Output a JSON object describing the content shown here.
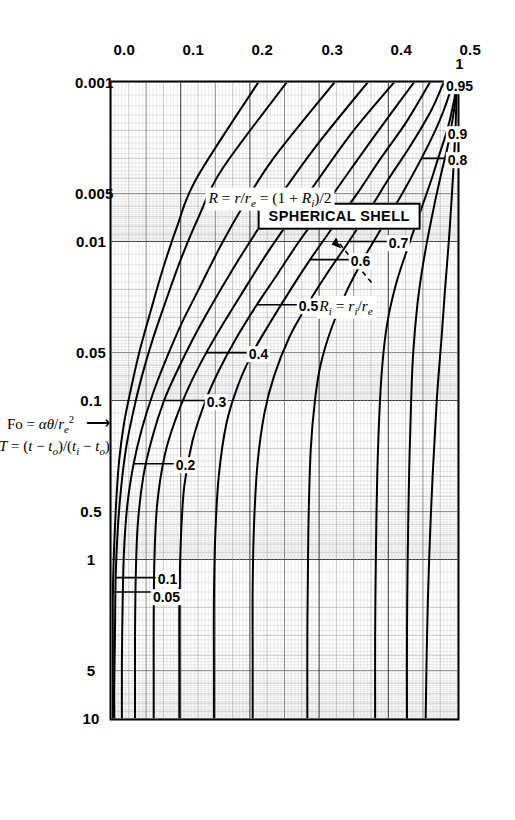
{
  "figure": {
    "title_box": "SPHERICAL SHELL",
    "definition": "R = r/re = (1 + Ri)/2",
    "annotation": "Ri = ri/re",
    "orientation": "rotated-90-clockwise"
  },
  "axes": {
    "x": {
      "label": "Fo = αθ/re²",
      "label_arrow": "⟶",
      "scale": "log",
      "range": [
        0.001,
        10
      ],
      "ticks": [
        "0.001",
        "0.005",
        "0.01",
        "0.05",
        "0.1",
        "0.5",
        "1",
        "5",
        "10"
      ],
      "tick_values": [
        0.001,
        0.005,
        0.01,
        0.05,
        0.1,
        0.5,
        1,
        5,
        10
      ]
    },
    "y": {
      "label": "T = (t − to)/(ti − to)",
      "label_arrow": "⟵",
      "scale": "linear",
      "range": [
        0.0,
        0.5
      ],
      "ticks": [
        "0.0",
        "0.1",
        "0.2",
        "0.3",
        "0.4",
        "0.5"
      ],
      "tick_values": [
        0.0,
        0.1,
        0.2,
        0.3,
        0.4,
        0.5
      ]
    }
  },
  "chart_data": {
    "type": "line",
    "title": "SPHERICAL SHELL",
    "xlabel": "Fo = αθ/re²",
    "ylabel": "T = (t − to)/(ti − to)",
    "xscale": "log",
    "yscale": "linear",
    "xlim": [
      0.001,
      10
    ],
    "ylim": [
      0.0,
      0.5
    ],
    "grid": "log-linear fine graph paper grid",
    "legend": "curve end labels (Ri values)",
    "series": [
      {
        "name": "1",
        "label": "1",
        "x": [
          0.001,
          0.0012,
          0.0015,
          0.002,
          0.003,
          0.005,
          0.008,
          0.012,
          0.02,
          0.04,
          0.1,
          0.3,
          1,
          3,
          10
        ],
        "y": [
          0.5,
          0.499,
          0.498,
          0.497,
          0.495,
          0.492,
          0.489,
          0.486,
          0.482,
          0.477,
          0.47,
          0.464,
          0.459,
          0.456,
          0.454
        ]
      },
      {
        "name": "0.95",
        "label": "0.95",
        "x": [
          0.001,
          0.0013,
          0.0018,
          0.0025,
          0.0035,
          0.005,
          0.007,
          0.01,
          0.015,
          0.025,
          0.05,
          0.1,
          0.3,
          1,
          3,
          10
        ],
        "y": [
          0.5,
          0.497,
          0.492,
          0.486,
          0.478,
          0.47,
          0.463,
          0.456,
          0.449,
          0.442,
          0.436,
          0.433,
          0.43,
          0.428,
          0.427,
          0.427
        ]
      },
      {
        "name": "0.9",
        "label": "0.9",
        "x": [
          0.001,
          0.0015,
          0.002,
          0.003,
          0.004,
          0.006,
          0.008,
          0.012,
          0.018,
          0.03,
          0.05,
          0.1,
          0.3,
          1,
          3,
          10
        ],
        "y": [
          0.5,
          0.492,
          0.485,
          0.472,
          0.463,
          0.449,
          0.439,
          0.425,
          0.412,
          0.4,
          0.393,
          0.388,
          0.384,
          0.382,
          0.381,
          0.381
        ]
      },
      {
        "name": "0.8",
        "label": "0.8",
        "x": [
          0.001,
          0.0015,
          0.002,
          0.003,
          0.005,
          0.008,
          0.012,
          0.02,
          0.035,
          0.06,
          0.1,
          0.2,
          0.5,
          1,
          3,
          10
        ],
        "y": [
          0.494,
          0.48,
          0.468,
          0.448,
          0.42,
          0.392,
          0.368,
          0.341,
          0.318,
          0.302,
          0.294,
          0.288,
          0.285,
          0.284,
          0.283,
          0.283
        ]
      },
      {
        "name": "0.7",
        "label": "0.7",
        "x": [
          0.001,
          0.0015,
          0.0025,
          0.004,
          0.006,
          0.01,
          0.016,
          0.025,
          0.04,
          0.07,
          0.12,
          0.25,
          0.6,
          1.5,
          4,
          10
        ],
        "y": [
          0.48,
          0.462,
          0.432,
          0.401,
          0.376,
          0.343,
          0.311,
          0.283,
          0.257,
          0.235,
          0.221,
          0.211,
          0.206,
          0.204,
          0.204,
          0.204
        ]
      },
      {
        "name": "0.6",
        "label": "0.6",
        "x": [
          0.001,
          0.0018,
          0.003,
          0.005,
          0.008,
          0.013,
          0.02,
          0.032,
          0.05,
          0.08,
          0.14,
          0.3,
          0.7,
          1.8,
          5,
          10
        ],
        "y": [
          0.46,
          0.425,
          0.389,
          0.355,
          0.321,
          0.287,
          0.259,
          0.23,
          0.204,
          0.183,
          0.166,
          0.155,
          0.15,
          0.148,
          0.148,
          0.148
        ]
      },
      {
        "name": "0.5",
        "label": "0.5",
        "x": [
          0.001,
          0.002,
          0.0035,
          0.006,
          0.01,
          0.016,
          0.025,
          0.04,
          0.065,
          0.1,
          0.18,
          0.35,
          0.8,
          2,
          5,
          10
        ],
        "y": [
          0.437,
          0.386,
          0.346,
          0.308,
          0.271,
          0.24,
          0.21,
          0.181,
          0.155,
          0.136,
          0.117,
          0.105,
          0.1,
          0.098,
          0.098,
          0.098
        ]
      },
      {
        "name": "0.4",
        "label": "0.4",
        "x": [
          0.001,
          0.002,
          0.004,
          0.007,
          0.012,
          0.02,
          0.032,
          0.05,
          0.08,
          0.13,
          0.22,
          0.45,
          1,
          2.5,
          6,
          10
        ],
        "y": [
          0.408,
          0.35,
          0.3,
          0.261,
          0.224,
          0.192,
          0.163,
          0.137,
          0.113,
          0.093,
          0.077,
          0.066,
          0.062,
          0.061,
          0.061,
          0.061
        ]
      },
      {
        "name": "0.3",
        "label": "0.3",
        "x": [
          0.001,
          0.0025,
          0.005,
          0.009,
          0.015,
          0.025,
          0.04,
          0.065,
          0.1,
          0.17,
          0.3,
          0.6,
          1.3,
          3,
          7,
          10
        ],
        "y": [
          0.37,
          0.296,
          0.246,
          0.207,
          0.175,
          0.145,
          0.119,
          0.095,
          0.076,
          0.059,
          0.046,
          0.038,
          0.035,
          0.034,
          0.034,
          0.034
        ]
      },
      {
        "name": "0.2",
        "label": "0.2",
        "x": [
          0.001,
          0.003,
          0.006,
          0.011,
          0.02,
          0.033,
          0.055,
          0.09,
          0.15,
          0.25,
          0.45,
          0.9,
          2,
          4.5,
          8,
          10
        ],
        "y": [
          0.322,
          0.234,
          0.19,
          0.156,
          0.126,
          0.101,
          0.079,
          0.06,
          0.044,
          0.032,
          0.023,
          0.018,
          0.016,
          0.015,
          0.015,
          0.015
        ]
      },
      {
        "name": "0.1",
        "label": "0.1",
        "x": [
          0.001,
          0.0035,
          0.007,
          0.013,
          0.024,
          0.042,
          0.07,
          0.12,
          0.2,
          0.35,
          0.65,
          1.3,
          3,
          6,
          9,
          10
        ],
        "y": [
          0.253,
          0.16,
          0.126,
          0.1,
          0.078,
          0.059,
          0.044,
          0.031,
          0.021,
          0.014,
          0.009,
          0.006,
          0.005,
          0.004,
          0.004,
          0.004
        ]
      },
      {
        "name": "0.05",
        "label": "0.05",
        "x": [
          0.001,
          0.004,
          0.008,
          0.015,
          0.028,
          0.05,
          0.085,
          0.14,
          0.24,
          0.42,
          0.8,
          1.6,
          3.5,
          7,
          10
        ],
        "y": [
          0.212,
          0.123,
          0.095,
          0.074,
          0.056,
          0.04,
          0.028,
          0.018,
          0.011,
          0.007,
          0.004,
          0.002,
          0.002,
          0.002,
          0.002
        ]
      }
    ]
  },
  "curve_labels": [
    {
      "text": "1",
      "pos": "left-edge"
    },
    {
      "text": "0.95",
      "pos": "left-edge"
    },
    {
      "text": "0.9",
      "pos": "left-edge"
    },
    {
      "text": "0.8",
      "pos": "upper-left"
    },
    {
      "text": "0.7",
      "pos": "upper-left"
    },
    {
      "text": "0.6",
      "pos": "upper-left"
    },
    {
      "text": "0.5",
      "pos": "upper-left"
    },
    {
      "text": "0.4",
      "pos": "upper-middle"
    },
    {
      "text": "0.3",
      "pos": "upper-middle"
    },
    {
      "text": "0.2",
      "pos": "upper-right"
    },
    {
      "text": "0.1",
      "pos": "upper-right"
    },
    {
      "text": "0.05",
      "pos": "upper-right"
    }
  ],
  "colors": {
    "curve": "#000000",
    "grid_minor": "#9a9a9a",
    "grid_major": "#3a3a3a",
    "axis": "#000000",
    "paper": "#ffffff",
    "scan_tint": "#d8d8d4"
  }
}
